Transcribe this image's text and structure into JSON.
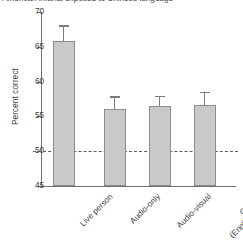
{
  "chart_data": {
    "type": "bar",
    "title": "American infants exposed to Chinese language",
    "xlabel": "",
    "ylabel": "Percent correct",
    "categories": [
      "Live person",
      "Audio-only",
      "Audio-visual",
      "Control (English only)"
    ],
    "category_lines": [
      [
        "Live person"
      ],
      [
        "Audio-only"
      ],
      [
        "Audio-visual"
      ],
      [
        "Control",
        "(English only)"
      ]
    ],
    "values": [
      65.8,
      56.1,
      56.5,
      56.6
    ],
    "errors": [
      2.1,
      1.6,
      1.3,
      1.8
    ],
    "ylim": [
      45,
      70
    ],
    "yticks": [
      45,
      50,
      55,
      60,
      65,
      70
    ],
    "ytick_labels": [
      "45",
      "50",
      "55",
      "60",
      "65",
      "70"
    ],
    "grid": false,
    "legend": null,
    "annotations": [
      {
        "type": "hline",
        "label": "chance",
        "value": 50,
        "style": "dashed"
      }
    ],
    "bar_color": "#c9c9c9",
    "bar_edge_color": "#8d8d8d",
    "error_color": "#7c7c7c",
    "axis_color": "#6e6e6e",
    "chance_line_color": "#5f5f5f"
  }
}
